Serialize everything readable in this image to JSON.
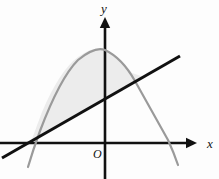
{
  "figure": {
    "background_color": "#fdfdfd",
    "width": 219,
    "height": 179
  },
  "axes": {
    "x_axis": {
      "label": "x",
      "color": "#111111",
      "label_x": 207,
      "label_y": 148,
      "line": {
        "x1": 0,
        "y1": 143,
        "x2": 193,
        "y2": 143
      },
      "arrow_tip_x": 197,
      "stroke_width": 2.6
    },
    "y_axis": {
      "label": "y",
      "color": "#111111",
      "label_x": 101,
      "label_y": 13,
      "line": {
        "x1": 105,
        "y1": 179,
        "x2": 105,
        "y2": 22
      },
      "arrow_tip_y": 17,
      "stroke_width": 2.6
    },
    "origin": {
      "label": "O",
      "label_x": 93,
      "label_y": 158
    }
  },
  "curves": {
    "parabola": {
      "name": "downward-parabola",
      "color": "#9a9a9a",
      "stroke_width": 2.2,
      "vertex": {
        "x": 105,
        "y": 50
      },
      "left_root": {
        "x": 33,
        "y": 143
      },
      "right_root": {
        "x": 172,
        "y": 143
      },
      "left_end": {
        "x": 28,
        "y": 167
      },
      "right_end": {
        "x": 178,
        "y": 165
      },
      "path": "M 28 167 Q 33 150 40 131 Q 60 78 78 60 Q 95 46 105 50 Q 122 58 135 81 Q 155 117 168 140 Q 174 153 178 165"
    },
    "line": {
      "name": "straight-line",
      "color": "#111111",
      "stroke_width": 3.0,
      "point_a": {
        "x": 2,
        "y": 158
      },
      "point_b": {
        "x": 180,
        "y": 56
      },
      "slope_description": "rising left to right"
    }
  },
  "shaded_region": {
    "name": "region-between-line-and-parabola",
    "fill_color": "#e9e9e9",
    "fill_opacity": 0.85,
    "description": "Area bounded above by the parabola and below by the line, between their two intersection points",
    "intersection_left": {
      "x": 31,
      "y": 142
    },
    "intersection_right": {
      "x": 144,
      "y": 77
    },
    "path": "M 31 142 Q 36 128 42 112 Q 60 70 78 57 Q 95 45 105 50 Q 120 56 132 73 L 144 77 L 31 142 Z"
  }
}
